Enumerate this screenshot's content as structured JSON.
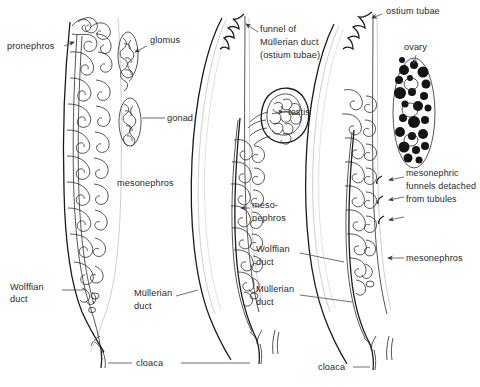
{
  "figure": {
    "background_color": "#ffffff",
    "ink_color": "#1b1b1b",
    "label_color": "#2a2a2a",
    "panel_count": 3
  },
  "panels": [
    {
      "id": "panel-larval",
      "name": "larval-pronephric-stage",
      "position": "left"
    },
    {
      "id": "panel-male",
      "name": "male-testis-stage",
      "position": "center"
    },
    {
      "id": "panel-female",
      "name": "female-ovary-stage",
      "position": "right"
    }
  ],
  "labels": {
    "pronephros": "pronephros",
    "glomus": "glomus",
    "gonad": "gonad",
    "mesonephros_left": "mesonephros",
    "wolffian_duct_left_line1": "Wolffian",
    "wolffian_duct_left_line2": "duct",
    "funnel_line1": "funnel of",
    "funnel_line2": "Müllerian duct",
    "funnel_line3": "(ostium tubae)",
    "testis": "testis",
    "mesonephros_mid_line1": "meso-",
    "mesonephros_mid_line2": "nephros",
    "mullerian_duct_mid_line1": "Müllerian",
    "mullerian_duct_mid_line2": "duct",
    "cloaca_left": "cloaca",
    "ostium_tubae": "ostium tubae",
    "ovary": "ovary",
    "funnels_line1": "mesonephric",
    "funnels_line2": "funnels detached",
    "funnels_line3": "from tubules",
    "mesonephros_right": "mesonephros",
    "wolffian_duct_right_line1": "Wolffian",
    "wolffian_duct_right_line2": "duct",
    "mullerian_duct_right_line1": "Müllerian",
    "mullerian_duct_right_line2": "duct",
    "cloaca_right": "cloaca"
  }
}
